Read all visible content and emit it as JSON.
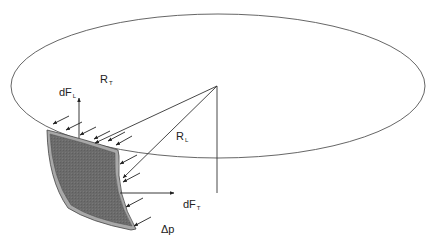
{
  "diagram": {
    "labels": {
      "rt_main": "R",
      "rt_sub": "T",
      "rl_main": "R",
      "rl_sub": "L",
      "dfl_main": "dF",
      "dfl_sub": "L",
      "dft_main": "dF",
      "dft_sub": "T",
      "dp": "Δp"
    },
    "colors": {
      "line": "#333333",
      "ellipse": "#555555",
      "panel_fill": "#6b6b6b",
      "panel_edge": "#a8a8a8",
      "panel_outline": "#444444"
    },
    "geometry": {
      "ellipse": {
        "cx": 218,
        "cy": 86,
        "rx": 207,
        "ry": 72
      },
      "apex": {
        "x": 217,
        "y": 86
      },
      "vertical_line_end_y": 193
    }
  }
}
